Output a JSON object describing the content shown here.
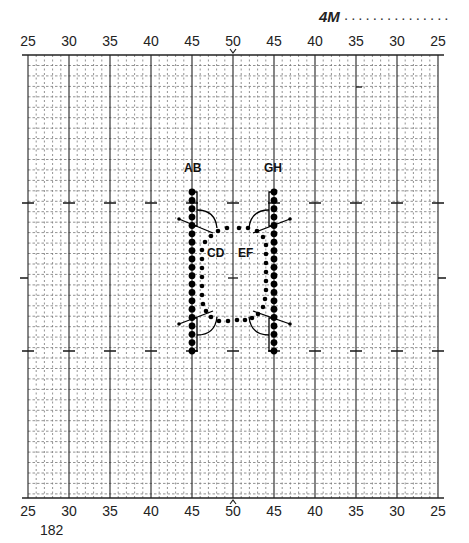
{
  "header": {
    "code": "4M",
    "dots": "..............."
  },
  "scale": {
    "top_ticks": [
      "25",
      "30",
      "35",
      "40",
      "45",
      "50",
      "45",
      "40",
      "35",
      "30",
      "25"
    ],
    "bottom_ticks": [
      "25",
      "30",
      "35",
      "40",
      "45",
      "50",
      "45",
      "40",
      "35",
      "30",
      "25"
    ],
    "center_marker_top": "v",
    "center_marker_bottom": "^"
  },
  "page_number": "182",
  "field": {
    "left": 28,
    "right": 438,
    "top": 55,
    "bottom": 498,
    "yard_line_step_px": 41,
    "sub_line_count": 5,
    "row_step_px": 10.45,
    "hash_rows_y": [
      203,
      278,
      351
    ],
    "line_color": "#222222",
    "grid_color": "#777777"
  },
  "formation": {
    "labels": [
      {
        "text": "AB",
        "x": 184,
        "y": 172
      },
      {
        "text": "GH",
        "x": 264,
        "y": 172
      },
      {
        "text": "CD",
        "x": 207,
        "y": 257
      },
      {
        "text": "EF",
        "x": 238,
        "y": 257
      }
    ],
    "left_column": {
      "x": 192,
      "y_start": 192,
      "y_end": 351,
      "count": 20,
      "r": 3.4
    },
    "right_column": {
      "x": 274,
      "y_start": 192,
      "y_end": 351,
      "count": 20,
      "r": 3.4
    },
    "dot_color": "#000000"
  }
}
